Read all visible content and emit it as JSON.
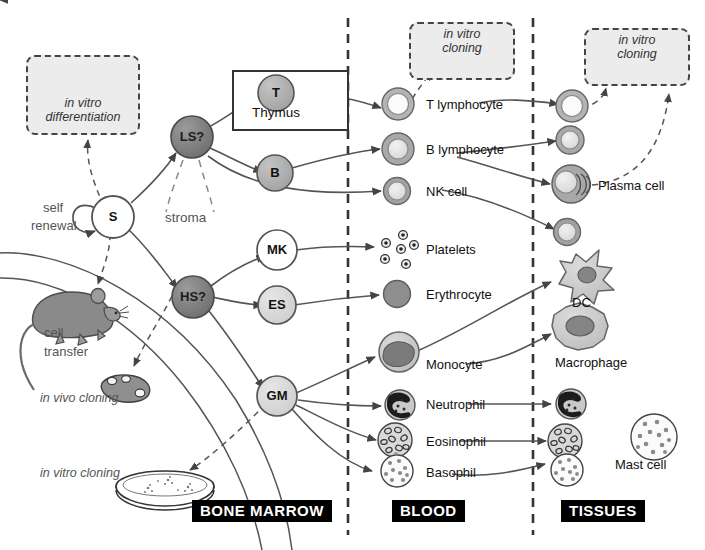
{
  "figure": {
    "compartments": [
      {
        "id": "bone-marrow",
        "label": "BONE MARROW"
      },
      {
        "id": "blood",
        "label": "BLOOD"
      },
      {
        "id": "tissues",
        "label": "TISSUES"
      }
    ]
  },
  "nodes": {
    "s": "S",
    "ls": "LS?",
    "hs": "HS?",
    "t": "T",
    "b": "B",
    "mk": "MK",
    "es": "ES",
    "gm": "GM"
  },
  "annotations": {
    "self_renewal_line1": "self",
    "self_renewal_line2": "renewal",
    "stroma": "stroma",
    "thymus": "Thymus",
    "cell_transfer_line1": "cell",
    "cell_transfer_line2": "transfer",
    "in_vivo_cloning": "in vivo cloning",
    "in_vitro_cloning_dish": "in vitro cloning",
    "in_vitro_differentiation_line1": "in vitro",
    "in_vitro_differentiation_line2": "differentiation",
    "in_vitro_cloning_line1": "in vitro",
    "in_vitro_cloning_line2": "cloning"
  },
  "cell_labels": {
    "t_lymphocyte": "T lymphocyte",
    "b_lymphocyte": "B lymphocyte",
    "nk_cell": "NK cell",
    "platelets": "Platelets",
    "erythrocyte": "Erythrocyte",
    "monocyte": "Monocyte",
    "neutrophil": "Neutrophil",
    "eosinophil": "Eosinophil",
    "basophil": "Basophil",
    "plasma_cell": "Plasma cell",
    "dc": "DC",
    "macrophage": "Macrophage",
    "mast_cell": "Mast cell"
  },
  "colors": {
    "background": "#ffffff",
    "line": "#555555",
    "dark_node": "#808080",
    "mid_node": "#b0b0b0",
    "light_node": "#d8d8d8",
    "white_node": "#ffffff",
    "cell_rim": "#9e9e9e",
    "cell_fill": "#cfcfcf",
    "erythrocyte": "#8e8e8e",
    "band_bg": "#000000",
    "band_fg": "#ffffff",
    "dashbox_bg": "#ececec",
    "dashbox_border": "#444444",
    "mouse": "#8a8a8a"
  },
  "icons": {
    "mouse": "mouse-icon",
    "spleen": "spleen-colony-icon",
    "petri_dish": "petri-dish-icon",
    "dendritic_cell": "dendritic-cell-icon",
    "macrophage": "macrophage-icon",
    "divider": "compartment-divider-dashed"
  }
}
